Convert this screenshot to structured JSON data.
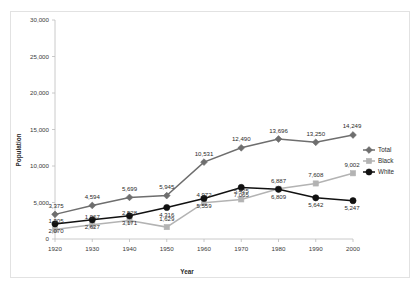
{
  "chart_data": {
    "type": "line",
    "title": "",
    "xlabel": "Year",
    "ylabel": "Population",
    "categories": [
      "1920",
      "1930",
      "1940",
      "1950",
      "1960",
      "1970",
      "1980",
      "1990",
      "2000"
    ],
    "x": [
      1920,
      1930,
      1940,
      1950,
      1960,
      1970,
      1980,
      1990,
      2000
    ],
    "xlim": [
      1920,
      2000
    ],
    "ylim": [
      0,
      30000
    ],
    "yticks": [
      0,
      5000,
      10000,
      15000,
      20000,
      25000,
      30000
    ],
    "ytick_labels": [
      "0",
      "5,000",
      "10,000",
      "15,000",
      "20,000",
      "25,000",
      "30,000"
    ],
    "grid": false,
    "legend_position": "right",
    "series": [
      {
        "name": "Total",
        "color": "#6e6e6e",
        "marker": "diamond",
        "values": [
          3375,
          4594,
          5699,
          5945,
          10531,
          12490,
          13696,
          13250,
          14249
        ],
        "labels": [
          "3,375",
          "4,594",
          "5,699",
          "5,945",
          "10,531",
          "12,490",
          "13,696",
          "13,250",
          "14,249"
        ]
      },
      {
        "name": "Black",
        "color": "#b3b3b3",
        "marker": "square",
        "values": [
          1305,
          1967,
          2528,
          1629,
          4972,
          5425,
          6887,
          7608,
          9002
        ],
        "labels": [
          "1,305",
          "1,967",
          "2,528",
          "1,629",
          "4,972",
          "5,425",
          "6,887",
          "7,608",
          "9,002"
        ]
      },
      {
        "name": "White",
        "color": "#111111",
        "marker": "circle",
        "values": [
          2070,
          2627,
          3171,
          4316,
          5559,
          7065,
          6809,
          5642,
          5247
        ],
        "labels": [
          "2,070",
          "2,627",
          "3,171",
          "4,316",
          "5,559",
          "7,065",
          "6,809",
          "5,642",
          "5,247"
        ]
      }
    ]
  },
  "legend": {
    "items": [
      {
        "label": "Total"
      },
      {
        "label": "Black"
      },
      {
        "label": "White"
      }
    ]
  }
}
